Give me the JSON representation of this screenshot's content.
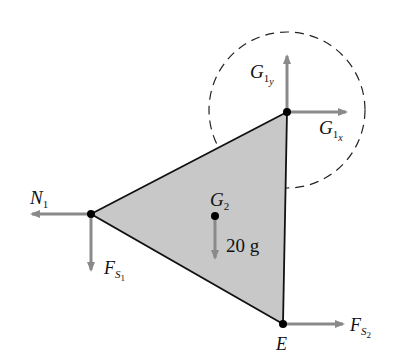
{
  "diagram": {
    "type": "free-body diagram",
    "colors": {
      "triangle_fill": "#c8c8c8",
      "outline": "#111111",
      "arrow": "#8a8a8a",
      "circle_dash": "#222222"
    },
    "labels": {
      "g1y": {
        "main": "G",
        "sub": "1",
        "subsub": "y"
      },
      "g1x": {
        "main": "G",
        "sub": "1",
        "subsub": "x"
      },
      "n1": {
        "main": "N",
        "sub": "1"
      },
      "fs1": {
        "main": "F",
        "sub": "S",
        "subsub": "1"
      },
      "g2": {
        "main": "G",
        "sub": "2"
      },
      "weight": "20 g",
      "fs2": {
        "main": "F",
        "sub": "S",
        "subsub": "2"
      },
      "e": "E"
    }
  }
}
